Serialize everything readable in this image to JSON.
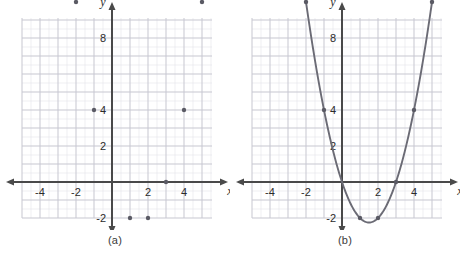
{
  "figure": {
    "panels": [
      {
        "caption": "(a)",
        "shows_curve": false
      },
      {
        "caption": "(b)",
        "shows_curve": true
      }
    ]
  },
  "axes": {
    "x_label": "x",
    "y_label": "y",
    "x_ticks": [
      "-4",
      "-2",
      "2",
      "4"
    ],
    "x_tick_values": [
      -4,
      -2,
      2,
      4
    ],
    "y_ticks": [
      "8",
      "4",
      "2",
      "-2"
    ],
    "y_tick_values": [
      8,
      4,
      2,
      -2
    ],
    "xlim": [
      -5.4,
      6.1
    ],
    "ylim": [
      -3.1,
      10.9
    ],
    "grid": true,
    "minor_grid": true
  },
  "colors": {
    "axis": "#4a4a4a",
    "grid_major": "#c9c9d2",
    "grid_minor": "#e4e4ea",
    "point": "#5a5a64",
    "curve": "#6b6b75",
    "text": "#2b2b2b",
    "background": "#ffffff"
  },
  "chart_data": {
    "type": "scatter",
    "title": "",
    "xlabel": "x",
    "ylabel": "y",
    "xlim": [
      -5.4,
      6.1
    ],
    "ylim": [
      -3.1,
      10.9
    ],
    "grid": true,
    "legend": "none",
    "series": [
      {
        "name": "data points",
        "marker": "filled-circle",
        "x": [
          -2,
          -1,
          1,
          2,
          3,
          4,
          5
        ],
        "y": [
          10,
          4,
          -2,
          -2,
          0,
          4,
          10
        ],
        "points": [
          {
            "x": -2,
            "y": 10
          },
          {
            "x": -1,
            "y": 4
          },
          {
            "x": 1,
            "y": -2
          },
          {
            "x": 2,
            "y": -2
          },
          {
            "x": 3,
            "y": 0
          },
          {
            "x": 4,
            "y": 4
          },
          {
            "x": 5,
            "y": 10
          }
        ]
      },
      {
        "name": "fitted parabola",
        "type": "line",
        "equation": "y = x^2 - 3x",
        "vertex": {
          "x": 1.5,
          "y": -2.25
        },
        "roots": [
          0,
          3
        ],
        "drawn_in_panel": "(b)"
      }
    ]
  }
}
